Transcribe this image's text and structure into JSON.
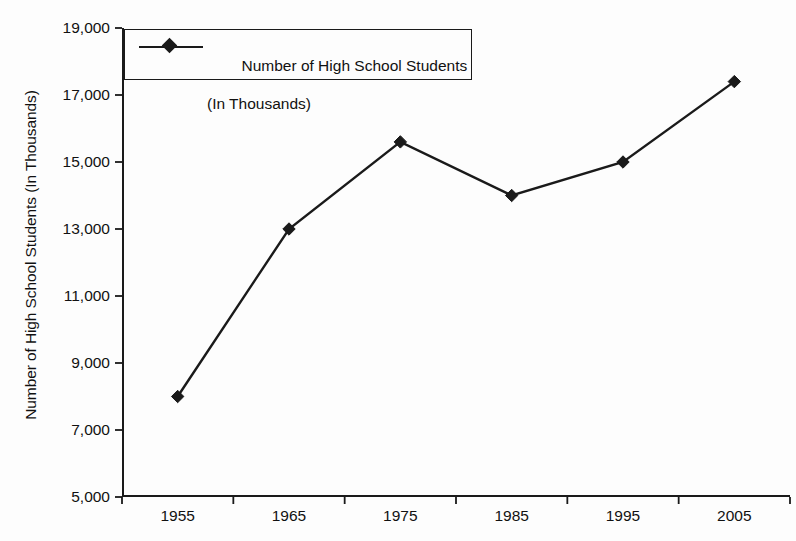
{
  "chart_data": {
    "type": "line",
    "title": "",
    "xlabel": "",
    "ylabel": "Number of High School Students (In Thousands)",
    "categories": [
      "1955",
      "1965",
      "1975",
      "1985",
      "1995",
      "2005"
    ],
    "series": [
      {
        "name": "Number of High School Students (In Thousands)",
        "values": [
          8000,
          13000,
          15600,
          14000,
          15000,
          17400
        ]
      }
    ],
    "ylim": [
      5000,
      19000
    ],
    "y_ticks": [
      19000,
      17000,
      15000,
      13000,
      11000,
      9000,
      7000,
      5000
    ],
    "y_tick_labels": [
      "19,000",
      "17,000",
      "15,000",
      "13,000",
      "11,000",
      "9,000",
      "7,000",
      "5,000"
    ],
    "x_tick_labels": [
      "1955",
      "1965",
      "1975",
      "1985",
      "1995",
      "2005"
    ],
    "grid": false,
    "marker": "diamond",
    "legend_position": "top-left"
  },
  "axes": {
    "y_title": "Number of High School Students (In Thousands)",
    "y_tick_labels": [
      "19,000",
      "17,000",
      "15,000",
      "13,000",
      "11,000",
      "9,000",
      "7,000",
      "5,000"
    ],
    "x_tick_labels": [
      "1955",
      "1965",
      "1975",
      "1985",
      "1995",
      "2005"
    ]
  },
  "legend": {
    "line1": "Number of High School Students",
    "line2": "(In Thousands)",
    "marker_icon": "diamond-marker-icon"
  },
  "colors": {
    "line": "#1a1a1a",
    "marker": "#1a1a1a",
    "axis": "#1a1a1a",
    "background": "#fdfdfd"
  }
}
